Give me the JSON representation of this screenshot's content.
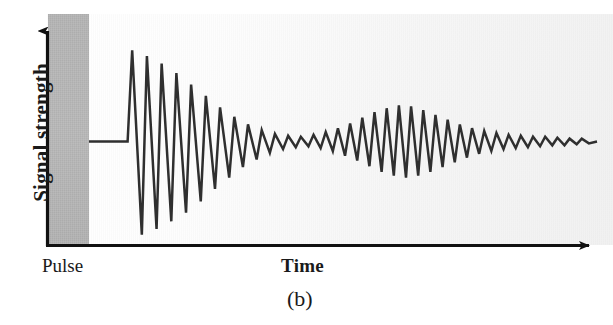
{
  "figure": {
    "panel_label": "(b)",
    "axes": {
      "y_label": "Signal strength",
      "x_label": "Time",
      "pulse_label": "Pulse"
    },
    "colors": {
      "trace": "#2b2b2b",
      "axis": "#111111",
      "pulse_band": "#bbbbbb",
      "background": "#f5f5f5"
    }
  },
  "chart_data": {
    "type": "line",
    "title": "(b)",
    "xlabel": "Time",
    "ylabel": "Signal strength",
    "grid": false,
    "legend": false,
    "annotations": [
      {
        "text": "Pulse",
        "x": 0.0,
        "note": "shaded band at start of time axis marking the excitation pulse"
      }
    ],
    "axis_ticks": {
      "x": [],
      "y": []
    },
    "xlim": [
      0,
      100
    ],
    "ylim": [
      -100,
      100
    ],
    "envelope": {
      "x": [
        8,
        12,
        16,
        20,
        24,
        28,
        32,
        36,
        40,
        44,
        48,
        52,
        56,
        60,
        64,
        68,
        72,
        76,
        80,
        84,
        88,
        92,
        96,
        100
      ],
      "amplitude": [
        95,
        88,
        80,
        70,
        58,
        46,
        34,
        24,
        16,
        10,
        7,
        9,
        14,
        22,
        30,
        36,
        38,
        34,
        27,
        19,
        13,
        9,
        6,
        4
      ]
    },
    "series": [
      {
        "name": "echo signal",
        "x": [
          0.0,
          7.6,
          8.5,
          10.4,
          11.4,
          13.3,
          14.3,
          16.2,
          17.2,
          19.1,
          20.1,
          22.0,
          23.0,
          24.8,
          25.8,
          27.6,
          28.6,
          30.3,
          31.3,
          33.0,
          34.0,
          35.6,
          36.6,
          38.2,
          39.2,
          40.7,
          41.7,
          43.2,
          44.2,
          45.6,
          46.6,
          48.0,
          49.0,
          50.4,
          51.4,
          52.8,
          53.8,
          55.2,
          56.2,
          57.6,
          58.6,
          60.0,
          61.0,
          62.4,
          63.4,
          64.8,
          65.8,
          67.2,
          68.2,
          69.6,
          70.6,
          72.0,
          73.0,
          74.4,
          75.4,
          76.8,
          77.8,
          79.2,
          80.2,
          81.6,
          82.6,
          84.0,
          85.0,
          86.4,
          87.4,
          88.8,
          89.8,
          91.2,
          92.2,
          93.6,
          94.6,
          96.0,
          97.0,
          98.4,
          100.0
        ],
        "y": [
          0.0,
          0.0,
          96.0,
          -98.0,
          90.0,
          -92.0,
          82.0,
          -84.0,
          72.0,
          -75.0,
          60.0,
          -63.0,
          48.0,
          -50.0,
          36.0,
          -38.0,
          26.0,
          -27.0,
          18.0,
          -19.0,
          12.0,
          -12.0,
          8.0,
          -8.0,
          6.0,
          -6.0,
          5.0,
          -5.0,
          7.0,
          -7.0,
          10.0,
          -10.0,
          14.0,
          -15.0,
          19.0,
          -20.0,
          25.0,
          -26.0,
          31.0,
          -32.0,
          35.0,
          -36.0,
          38.0,
          -38.0,
          37.0,
          -36.0,
          33.0,
          -32.0,
          28.0,
          -27.0,
          23.0,
          -22.0,
          18.0,
          -17.0,
          14.0,
          -13.0,
          11.0,
          -10.0,
          9.0,
          -8.0,
          7.0,
          -7.0,
          6.0,
          -6.0,
          5.0,
          -5.0,
          5.0,
          -4.0,
          4.0,
          -4.0,
          3.0,
          -3.0,
          3.0,
          -2.0,
          0.0
        ]
      }
    ]
  }
}
